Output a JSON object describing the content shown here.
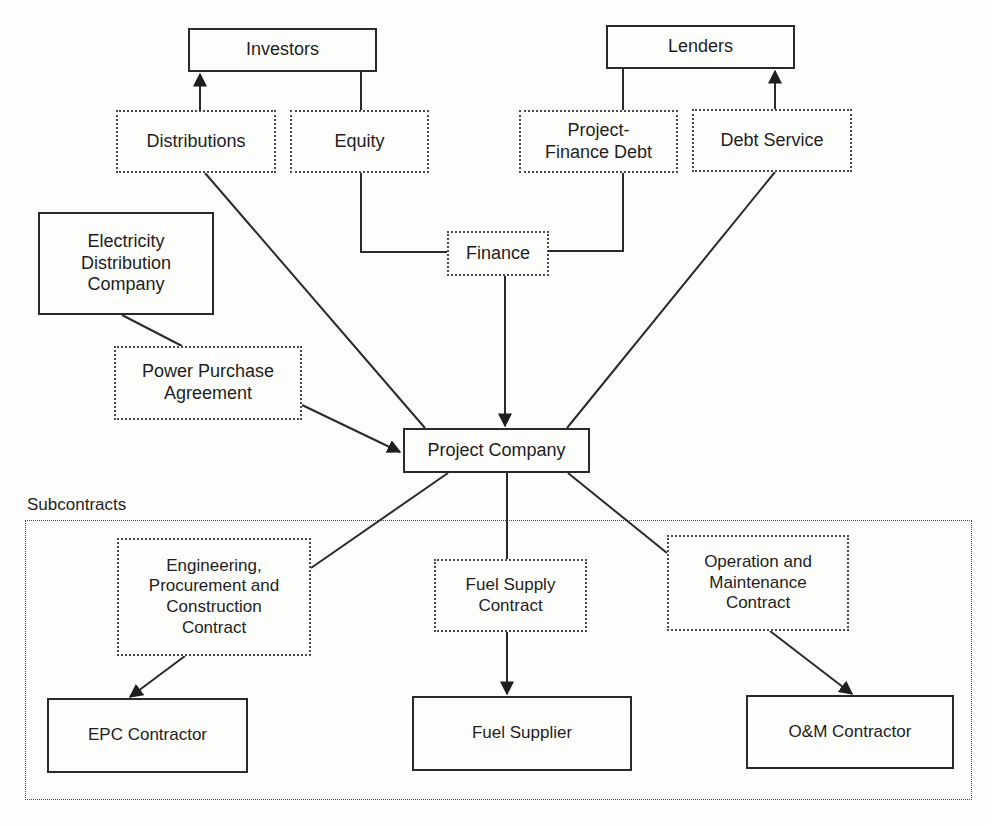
{
  "diagram": {
    "type": "project-finance-structure",
    "colors": {
      "line": "#2a2a2a",
      "background": "#fdfdfb"
    },
    "nodes": {
      "investors": "Investors",
      "lenders": "Lenders",
      "distributions": "Distributions",
      "equity": "Equity",
      "project_finance_debt": "Project-\nFinance Debt",
      "debt_service": "Debt Service",
      "finance": "Finance",
      "electricity_distribution_company": "Electricity\nDistribution\nCompany",
      "power_purchase_agreement": "Power Purchase\nAgreement",
      "project_company": "Project Company",
      "epc_contract": "Engineering,\nProcurement and\nConstruction\nContract",
      "fuel_supply_contract": "Fuel Supply\nContract",
      "om_contract": "Operation and\nMaintenance\nContract",
      "epc_contractor": "EPC Contractor",
      "fuel_supplier": "Fuel Supplier",
      "om_contractor": "O&M Contractor"
    },
    "group_label": "Subcontracts",
    "edges": [
      {
        "from": "distributions",
        "to": "investors",
        "arrow": true
      },
      {
        "from": "investors",
        "to": "equity",
        "arrow": false
      },
      {
        "from": "equity",
        "to": "finance",
        "arrow": false
      },
      {
        "from": "lenders",
        "to": "project_finance_debt",
        "arrow": false
      },
      {
        "from": "project_finance_debt",
        "to": "finance",
        "arrow": false
      },
      {
        "from": "debt_service",
        "to": "lenders",
        "arrow": true
      },
      {
        "from": "finance",
        "to": "project_company",
        "arrow": true
      },
      {
        "from": "project_company",
        "to": "distributions",
        "arrow": false
      },
      {
        "from": "project_company",
        "to": "debt_service",
        "arrow": false
      },
      {
        "from": "electricity_distribution_company",
        "to": "power_purchase_agreement",
        "arrow": false
      },
      {
        "from": "power_purchase_agreement",
        "to": "project_company",
        "arrow": true
      },
      {
        "from": "project_company",
        "to": "epc_contract",
        "arrow": false
      },
      {
        "from": "project_company",
        "to": "fuel_supply_contract",
        "arrow": false
      },
      {
        "from": "project_company",
        "to": "om_contract",
        "arrow": false
      },
      {
        "from": "epc_contract",
        "to": "epc_contractor",
        "arrow": true
      },
      {
        "from": "fuel_supply_contract",
        "to": "fuel_supplier",
        "arrow": true
      },
      {
        "from": "om_contract",
        "to": "om_contractor",
        "arrow": true
      }
    ]
  }
}
